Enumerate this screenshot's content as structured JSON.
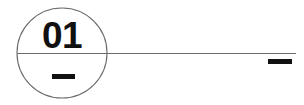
{
  "drawing": {
    "background_color": "#ffffff",
    "line_color": "#5a5a5a",
    "ink_color": "#111111",
    "callout": {
      "label": "01",
      "shape": "circle",
      "center_x": 62,
      "center_y": 53,
      "radius": 45,
      "stroke_width": 1
    },
    "divider_line": {
      "name": "balloon-divider-line",
      "x1": 17,
      "y1": 53.5,
      "x2": 296,
      "y2": 53.5,
      "stroke_width": 1
    },
    "lower_dash": {
      "name": "balloon-lower-dash",
      "x": 52,
      "y": 74,
      "width": 23,
      "height": 5
    },
    "end_dash": {
      "name": "leader-end-dash",
      "x": 268,
      "y": 59,
      "width": 24,
      "height": 5
    }
  }
}
